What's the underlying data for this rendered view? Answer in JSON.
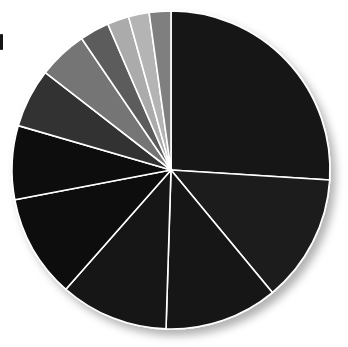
{
  "chart_data": {
    "type": "pie",
    "title": "",
    "subtitle": "",
    "xlabel": "",
    "ylabel": "",
    "legend": "none",
    "grid": false,
    "start_angle_deg": 0,
    "direction": "clockwise",
    "center": {
      "x": 171,
      "y": 170
    },
    "radius": 159,
    "stroke_color": "#ffffff",
    "stroke_width": 1.6,
    "background": "#ffffff",
    "labels": [
      "Slice 1",
      "Slice 2",
      "Slice 3",
      "Slice 4",
      "Slice 5",
      "Slice 6",
      "Slice 7",
      "Slice 8",
      "Slice 9",
      "Slice 10",
      "Slice 11",
      "Slice 12"
    ],
    "values": [
      26.0,
      13.0,
      11.5,
      11.0,
      10.5,
      7.5,
      6.0,
      5.0,
      3.0,
      2.2,
      2.1,
      2.2
    ],
    "colors": [
      "#171717",
      "#1c1c1c",
      "#191919",
      "#141414",
      "#0b0b0b",
      "#070707",
      "#303030",
      "#757575",
      "#5c5c5c",
      "#ababab",
      "#b4b4b4",
      "#7f7f7f"
    ],
    "units": "percent",
    "total": 100.0
  },
  "decorations": {
    "shadow": {
      "name": "drop-shadow",
      "color": "rgba(0,0,0,0.28)",
      "offset_x": 5,
      "offset_y": 6,
      "blur": 8
    },
    "edge_mark": {
      "name": "left-edge-mark",
      "color": "#151515"
    }
  }
}
